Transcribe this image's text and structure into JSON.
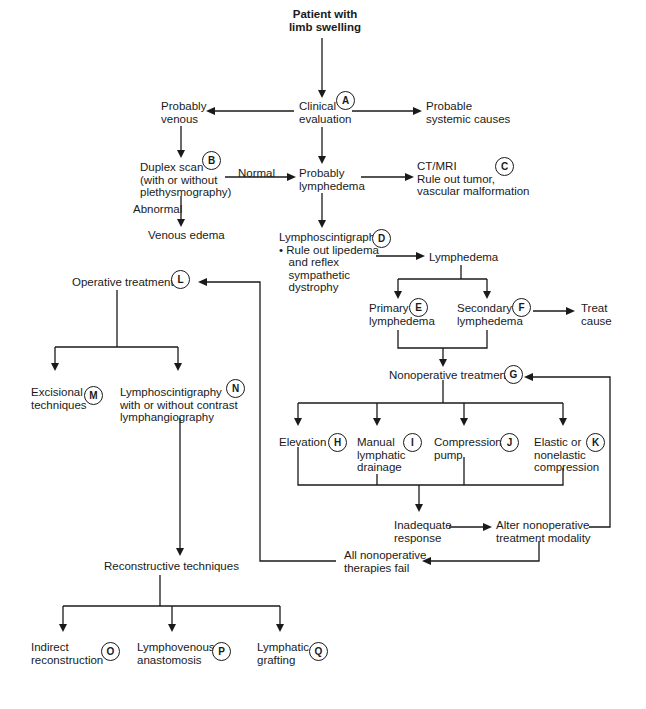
{
  "diagram": {
    "nodes": [
      {
        "id": "start",
        "lines": [
          "Patient with",
          "limb swelling"
        ],
        "bold": true,
        "x": 325,
        "y": 8,
        "align": "center"
      },
      {
        "id": "A",
        "lines": [
          "Clinical",
          "evaluation"
        ],
        "x": 299,
        "y": 100,
        "badge": "A",
        "bx": 336,
        "by": 91
      },
      {
        "id": "venous",
        "lines": [
          "Probably",
          "venous"
        ],
        "x": 161,
        "y": 100
      },
      {
        "id": "systemic",
        "lines": [
          "Probable",
          "systemic causes"
        ],
        "x": 426,
        "y": 100
      },
      {
        "id": "B",
        "lines": [
          "Duplex scan",
          "(with or without",
          "plethysmography)"
        ],
        "x": 140,
        "y": 161,
        "badge": "B",
        "bx": 202,
        "by": 151
      },
      {
        "id": "lymph_prob",
        "lines": [
          "Probably",
          "lymphedema"
        ],
        "x": 299,
        "y": 167
      },
      {
        "id": "C",
        "lines": [
          "CT/MRI",
          "Rule out tumor,",
          "vascular malformation"
        ],
        "x": 417,
        "y": 160,
        "badge": "C",
        "bx": 495,
        "by": 157
      },
      {
        "id": "venous_edema",
        "lines": [
          "Venous edema"
        ],
        "x": 148,
        "y": 229
      },
      {
        "id": "D",
        "lines": [
          "Lymphoscintigraphy",
          "• Rule out lipedema",
          "   and reflex",
          "   sympathetic",
          "   dystrophy"
        ],
        "x": 279,
        "y": 231,
        "badge": "D",
        "bx": 372,
        "by": 229
      },
      {
        "id": "lymphedema",
        "lines": [
          "Lymphedema"
        ],
        "x": 429,
        "y": 251
      },
      {
        "id": "L",
        "lines": [
          "Operative treatment"
        ],
        "x": 72,
        "y": 276,
        "badge": "L",
        "bx": 171,
        "by": 270
      },
      {
        "id": "E",
        "lines": [
          "Primary",
          "lymphedema"
        ],
        "x": 369,
        "y": 302,
        "badge": "E",
        "bx": 409,
        "by": 298
      },
      {
        "id": "F",
        "lines": [
          "Secondary",
          "lymphedema"
        ],
        "x": 457,
        "y": 302,
        "badge": "F",
        "bx": 512,
        "by": 298
      },
      {
        "id": "treat_cause",
        "lines": [
          "Treat",
          "cause"
        ],
        "x": 581,
        "y": 302
      },
      {
        "id": "G",
        "lines": [
          "Nonoperative treatment"
        ],
        "x": 389,
        "y": 369,
        "badge": "G",
        "bx": 504,
        "by": 365
      },
      {
        "id": "M",
        "lines": [
          "Excisional",
          "techniques"
        ],
        "x": 31,
        "y": 386,
        "badge": "M",
        "bx": 84,
        "by": 386
      },
      {
        "id": "N",
        "lines": [
          "Lymphoscintigraphy",
          "with or without contrast",
          "lymphangiography"
        ],
        "x": 120,
        "y": 386,
        "badge": "N",
        "bx": 226,
        "by": 379
      },
      {
        "id": "H",
        "lines": [
          "Elevation"
        ],
        "x": 279,
        "y": 436,
        "badge": "H",
        "bx": 328,
        "by": 433
      },
      {
        "id": "I",
        "lines": [
          "Manual",
          "lymphatic",
          "drainage"
        ],
        "x": 357,
        "y": 436,
        "badge": "I",
        "bx": 403,
        "by": 433
      },
      {
        "id": "J",
        "lines": [
          "Compression",
          "pump"
        ],
        "x": 434,
        "y": 436,
        "badge": "J",
        "bx": 500,
        "by": 433
      },
      {
        "id": "K",
        "lines": [
          "Elastic or",
          "nonelastic",
          "compression"
        ],
        "x": 534,
        "y": 436,
        "badge": "K",
        "bx": 586,
        "by": 433
      },
      {
        "id": "inadequate",
        "lines": [
          "Inadequate",
          "response"
        ],
        "x": 394,
        "y": 519
      },
      {
        "id": "alter",
        "lines": [
          "Alter nonoperative",
          "treatment modality"
        ],
        "x": 496,
        "y": 519
      },
      {
        "id": "all_fail",
        "lines": [
          "All nonoperative",
          "therapies fail"
        ],
        "x": 344,
        "y": 549
      },
      {
        "id": "recon",
        "lines": [
          "Reconstructive techniques"
        ],
        "x": 104,
        "y": 560
      },
      {
        "id": "O",
        "lines": [
          "Indirect",
          "reconstruction"
        ],
        "x": 31,
        "y": 641,
        "badge": "O",
        "bx": 101,
        "by": 642
      },
      {
        "id": "P",
        "lines": [
          "Lymphovenous",
          "anastomosis"
        ],
        "x": 137,
        "y": 641,
        "badge": "P",
        "bx": 212,
        "by": 642
      },
      {
        "id": "Q",
        "lines": [
          "Lymphatic",
          "grafting"
        ],
        "x": 257,
        "y": 641,
        "badge": "Q",
        "bx": 309,
        "by": 642
      }
    ],
    "edge_labels": [
      {
        "id": "normal",
        "text": "Normal",
        "x": 238,
        "y": 167
      },
      {
        "id": "abnormal",
        "text": "Abnormal",
        "x": 133,
        "y": 203
      }
    ]
  }
}
